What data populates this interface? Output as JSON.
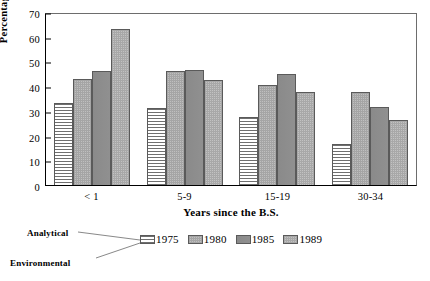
{
  "chart_data": {
    "type": "bar",
    "title": "",
    "xlabel": "Years since the B.S.",
    "ylabel": "Percentage",
    "ylim": [
      0,
      70
    ],
    "yticks": [
      0,
      10,
      20,
      30,
      40,
      50,
      60,
      70
    ],
    "ytick_labels": [
      "0",
      "10",
      "20",
      "30",
      "40",
      "50",
      "60",
      "70"
    ],
    "categories": [
      "< 1",
      "5-9",
      "15-19",
      "30-34"
    ],
    "grid": false,
    "legend_position": "below-plot",
    "series": [
      {
        "name": "1975",
        "fill": "horizontal-lines",
        "color": "#f2f2f2",
        "values": [
          33,
          31,
          27.5,
          16.5
        ]
      },
      {
        "name": "1980",
        "fill": "fine-dots",
        "color": "#bfbfbf",
        "values": [
          43,
          46,
          40.5,
          37.5
        ]
      },
      {
        "name": "1985",
        "fill": "solid-gray",
        "color": "#8e8e8e",
        "values": [
          46,
          46.5,
          45,
          31.5
        ]
      },
      {
        "name": "1989",
        "fill": "fine-dots",
        "color": "#c2c2c2",
        "values": [
          63,
          42.5,
          37.5,
          26.5
        ]
      }
    ],
    "annotations": [
      {
        "text": "Analytical",
        "target": "legend-swatch-1975"
      },
      {
        "text": "Environmental",
        "target": "legend-swatch-1975"
      }
    ]
  },
  "axes": {
    "y_label": "Percentage",
    "x_label": "Years since the B.S.",
    "y_ticks": [
      "70",
      "60",
      "50",
      "40",
      "30",
      "20",
      "10",
      "0"
    ],
    "x_ticks": [
      "< 1",
      "5-9",
      "15-19",
      "30-34"
    ]
  },
  "legend": {
    "items": [
      {
        "label": "1975"
      },
      {
        "label": "1980"
      },
      {
        "label": "1985"
      },
      {
        "label": "1989"
      }
    ]
  },
  "callouts": {
    "analytical": "Analytical",
    "environmental": "Environmental"
  },
  "colors": {
    "axis": "#000000",
    "frame": "#6d6d6d",
    "bar_1975": "#f2f2f2",
    "bar_1980": "#bfbfbf",
    "bar_1985": "#8e8e8e",
    "bar_1989": "#c2c2c2",
    "background": "#ffffff"
  }
}
